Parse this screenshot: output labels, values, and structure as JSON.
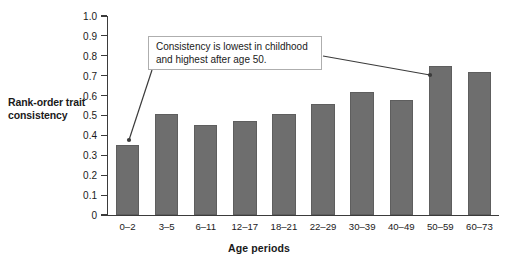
{
  "chart_data": {
    "type": "bar",
    "title": "",
    "xlabel": "Age periods",
    "ylabel": "Rank-order trait consistency",
    "categories": [
      "0–2",
      "3–5",
      "6–11",
      "12–17",
      "18–21",
      "22–29",
      "30–39",
      "40–49",
      "50–59",
      "60–73"
    ],
    "values": [
      0.35,
      0.51,
      0.45,
      0.47,
      0.51,
      0.56,
      0.62,
      0.58,
      0.75,
      0.72
    ],
    "ylim": [
      0,
      1.0
    ],
    "ytick_labels": [
      "1.0",
      "0.9",
      "0.8",
      "0.7",
      "0.6",
      "0.5",
      "0.4",
      "0.3",
      "0.2",
      "0.1",
      "0"
    ],
    "ytick_values": [
      1.0,
      0.9,
      0.8,
      0.7,
      0.6,
      0.5,
      0.4,
      0.3,
      0.2,
      0.1,
      0
    ],
    "grid": false,
    "legend": "none",
    "bar_color": "#6e6e6e",
    "axis_color": "#3b3b3b",
    "annotations": [
      {
        "text": "Consistency is lowest in childhood and highest after age 50.",
        "line1": "Consistency is lowest in childhood",
        "line2": "and highest after age 50.",
        "points_to": [
          "0–2",
          "50–59"
        ]
      }
    ]
  }
}
